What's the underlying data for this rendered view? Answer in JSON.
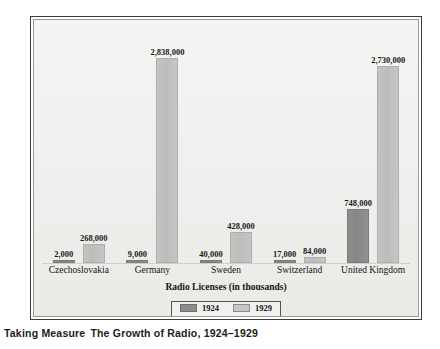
{
  "caption": {
    "lead": "Taking Measure",
    "title": "The Growth of Radio, 1924–1929"
  },
  "legend": {
    "items": [
      {
        "label": "1924",
        "color": "#8c8c8a"
      },
      {
        "label": "1929",
        "color": "#c6c6c4"
      }
    ]
  },
  "colors": {
    "series_1924": "#8c8c8a",
    "series_1929": "#c6c6c4",
    "panel_background": "#f1f1ef",
    "frame_border": "#3c3c3c",
    "text": "#141414"
  },
  "chart_data": {
    "type": "bar",
    "title": "The Growth of Radio, 1924–1929",
    "subtitle": "",
    "xlabel": "Radio Licenses (in thousands)",
    "ylabel": "",
    "grid": false,
    "legend_position": "bottom",
    "ylim": [
      0,
      2838000
    ],
    "categories": [
      "Czechoslovakia",
      "Germany",
      "Sweden",
      "Switzerland",
      "United Kingdom"
    ],
    "series": [
      {
        "name": "1924",
        "color": "#8c8c8a",
        "values": [
          2000,
          9000,
          40000,
          17000,
          748000
        ],
        "labels": [
          "2,000",
          "9,000",
          "40,000",
          "17,000",
          "748,000"
        ]
      },
      {
        "name": "1929",
        "color": "#c6c6c4",
        "values": [
          268000,
          2838000,
          428000,
          84000,
          2730000
        ],
        "labels": [
          "268,000",
          "2,838,000",
          "428,000",
          "84,000",
          "2,730,000"
        ]
      }
    ]
  }
}
